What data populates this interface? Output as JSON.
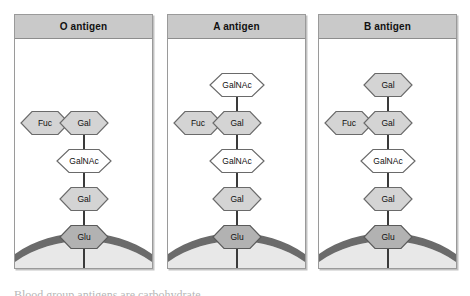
{
  "figure": {
    "title_caption_partial": "Blood group antigens are carbohydrate",
    "colors": {
      "panel_border": "#9a9a9a",
      "header_fill": "#c9c9c9",
      "hex_light": "#d4d4d4",
      "hex_white": "#ffffff",
      "hex_dark": "#b2b2b2",
      "hex_outline": "#6a6a6a",
      "membrane_band": "#6b6b6b",
      "cytoplasm": "#e8e8e8",
      "link_line": "#3a3a3a"
    },
    "panels": [
      {
        "id": "o-antigen",
        "title": "O antigen",
        "branch": {
          "label": "Fuc",
          "shade": "light"
        },
        "chain": [
          {
            "label": "Gal",
            "shade": "light"
          },
          {
            "label": "GalNAc",
            "shade": "white"
          },
          {
            "label": "Gal",
            "shade": "light"
          },
          {
            "label": "Glu",
            "shade": "dark"
          }
        ],
        "anchor": "ceramide"
      },
      {
        "id": "a-antigen",
        "title": "A antigen",
        "branch": {
          "label": "Fuc",
          "shade": "light"
        },
        "chain": [
          {
            "label": "GalNAc",
            "shade": "white"
          },
          {
            "label": "Gal",
            "shade": "light"
          },
          {
            "label": "GalNAc",
            "shade": "white"
          },
          {
            "label": "Gal",
            "shade": "light"
          },
          {
            "label": "Glu",
            "shade": "dark"
          }
        ],
        "anchor": "ceramide"
      },
      {
        "id": "b-antigen",
        "title": "B antigen",
        "branch": {
          "label": "Fuc",
          "shade": "light"
        },
        "chain": [
          {
            "label": "Gal",
            "shade": "light"
          },
          {
            "label": "Gal",
            "shade": "light"
          },
          {
            "label": "GalNAc",
            "shade": "white"
          },
          {
            "label": "Gal",
            "shade": "light"
          },
          {
            "label": "Glu",
            "shade": "dark"
          }
        ],
        "anchor": "ceramide"
      }
    ]
  }
}
